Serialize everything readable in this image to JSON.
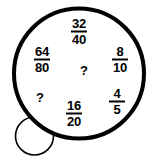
{
  "canvas": {
    "width": 156,
    "height": 158,
    "background": "#ffffff"
  },
  "bubble": {
    "stroke_color": "#000000",
    "fill_color": "#ffffff",
    "main_circle": {
      "cx": 79,
      "cy": 73.5,
      "r": 65,
      "stroke_width": 4
    },
    "tail_circle": {
      "cx": 34.5,
      "cy": 136,
      "r": 19,
      "stroke_width": 1.6
    }
  },
  "items": [
    {
      "name": "fraction-32-40",
      "type": "fraction",
      "numerator": "32",
      "denominator": "40",
      "x": 79,
      "y": 30
    },
    {
      "name": "fraction-64-80",
      "type": "fraction",
      "numerator": "64",
      "denominator": "80",
      "x": 42,
      "y": 58
    },
    {
      "name": "fraction-8-10",
      "type": "fraction",
      "numerator": "8",
      "denominator": "10",
      "x": 120,
      "y": 58
    },
    {
      "name": "question-mark-center",
      "type": "question",
      "text": "?",
      "x": 84,
      "y": 70
    },
    {
      "name": "question-mark-left",
      "type": "question",
      "text": "?",
      "x": 40,
      "y": 97
    },
    {
      "name": "fraction-16-20",
      "type": "fraction",
      "numerator": "16",
      "denominator": "20",
      "x": 74,
      "y": 112
    },
    {
      "name": "fraction-4-5",
      "type": "fraction",
      "numerator": "4",
      "denominator": "5",
      "x": 117,
      "y": 100
    }
  ]
}
